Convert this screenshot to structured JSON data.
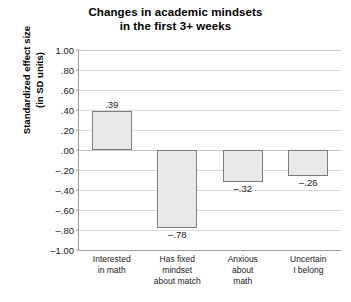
{
  "chart_data": {
    "type": "bar",
    "title": "Changes in academic mindsets in the first 3+ weeks",
    "title_lines": [
      "Changes in academic mindsets",
      "in the first 3+ weeks"
    ],
    "xlabel": "",
    "ylabel": "Standardized effect size (in SD units)",
    "ylabel_lines": [
      "Standardized effect size",
      "(in SD units)"
    ],
    "categories": [
      "Interested in math",
      "Has fixed mindset about match",
      "Anxious about math",
      "Uncertain I belong"
    ],
    "category_lines": [
      [
        "Interested",
        "in math"
      ],
      [
        "Has fixed",
        "mindset",
        "about match"
      ],
      [
        "Anxious",
        "about",
        "math"
      ],
      [
        "Uncertain",
        "I belong"
      ]
    ],
    "values": [
      0.39,
      -0.78,
      -0.32,
      -0.26
    ],
    "value_labels": [
      ".39",
      "–.78",
      "–.32",
      "–.26"
    ],
    "ylim": [
      -1.0,
      1.0
    ],
    "ytick_values": [
      1.0,
      0.8,
      0.6,
      0.4,
      0.2,
      0.0,
      -0.2,
      -0.4,
      -0.6,
      -0.8,
      -1.0
    ],
    "ytick_labels": [
      "1.00",
      ".80",
      ".60",
      ".40",
      ".20",
      ".00",
      "–.20",
      "–.40",
      "–.60",
      "–.80",
      "–1.00"
    ],
    "grid": true,
    "legend": "none",
    "bar_fill_color": "#e9e9e9",
    "bar_border_color": "#7d7d7d",
    "gridline_color": "#d8d8d8",
    "axis_color": "#9a9a9a",
    "background_color": "#ffffff"
  }
}
